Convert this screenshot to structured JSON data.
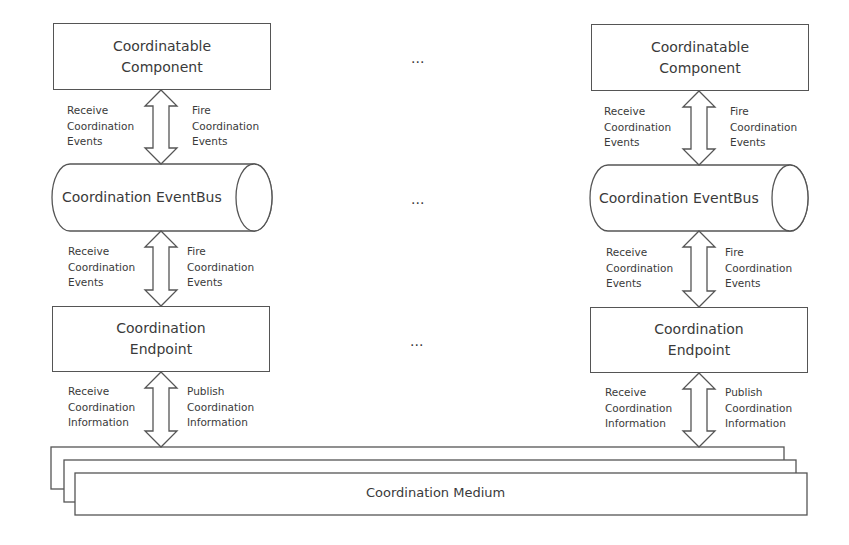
{
  "left_column": {
    "component": {
      "line1": "Coordinatable",
      "line2": "Component"
    },
    "arrow1": {
      "left": [
        "Receive",
        "Coordination",
        "Events"
      ],
      "right": [
        "Fire",
        "Coordination",
        "Events"
      ]
    },
    "eventbus": {
      "label": "Coordination EventBus"
    },
    "arrow2": {
      "left": [
        "Receive",
        "Coordination",
        "Events"
      ],
      "right": [
        "Fire",
        "Coordination",
        "Events"
      ]
    },
    "endpoint": {
      "line1": "Coordination",
      "line2": "Endpoint"
    },
    "arrow3": {
      "left": [
        "Receive",
        "Coordination",
        "Information"
      ],
      "right": [
        "Publish",
        "Coordination",
        "Information"
      ]
    }
  },
  "right_column": {
    "component": {
      "line1": "Coordinatable",
      "line2": "Component"
    },
    "arrow1": {
      "left": [
        "Receive",
        "Coordination",
        "Events"
      ],
      "right": [
        "Fire",
        "Coordination",
        "Events"
      ]
    },
    "eventbus": {
      "label": "Coordination EventBus"
    },
    "arrow2": {
      "left": [
        "Receive",
        "Coordination",
        "Events"
      ],
      "right": [
        "Fire",
        "Coordination",
        "Events"
      ]
    },
    "endpoint": {
      "line1": "Coordination",
      "line2": "Endpoint"
    },
    "arrow3": {
      "left": [
        "Receive",
        "Coordination",
        "Information"
      ],
      "right": [
        "Publish",
        "Coordination",
        "Information"
      ]
    }
  },
  "ellipsis": [
    "...",
    "...",
    "..."
  ],
  "medium": {
    "label": "Coordination Medium"
  },
  "colors": {
    "stroke": "#555555",
    "text": "#3a3a3a",
    "background": "#ffffff"
  }
}
